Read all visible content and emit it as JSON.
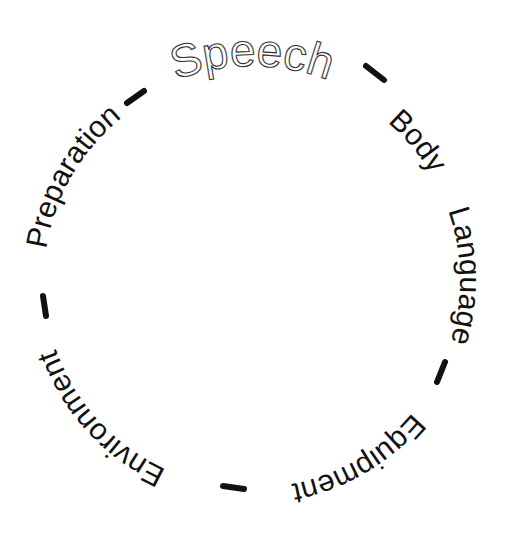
{
  "diagram": {
    "type": "circular-text-cycle",
    "title": "Speech",
    "items": [
      {
        "label": "Speech",
        "angle": 0,
        "style": "outlined"
      },
      {
        "label": "Body",
        "angle": 50
      },
      {
        "label": "Language",
        "angle": 88
      },
      {
        "label": "Equipment",
        "angle": 150
      },
      {
        "label": "Environment",
        "angle": 228
      },
      {
        "label": "Preparation",
        "angle": 300
      }
    ],
    "separators": [
      {
        "angle": 33
      },
      {
        "angle": 118
      },
      {
        "angle": 185
      },
      {
        "angle": 264
      },
      {
        "angle": -32
      }
    ],
    "colors": {
      "text": "#111111",
      "outline": "#333333",
      "background": "#ffffff"
    }
  }
}
